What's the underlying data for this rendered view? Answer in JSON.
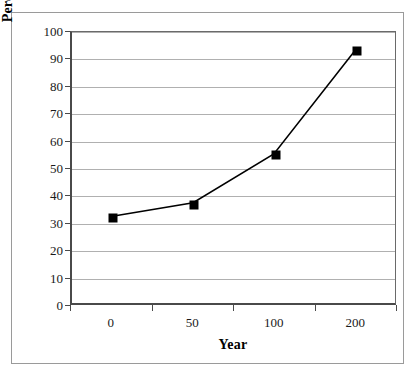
{
  "chart_data": {
    "type": "line",
    "title": "",
    "xlabel": "Year",
    "ylabel": "Percentage of Federal Lands",
    "categories": [
      "0",
      "50",
      "100",
      "200"
    ],
    "values": [
      32,
      37,
      55,
      93
    ],
    "series": [
      {
        "name": "Percentage of Federal Lands",
        "values": [
          32,
          37,
          55,
          93
        ]
      }
    ],
    "ylim": [
      0,
      100
    ],
    "ytick_labels": [
      "0",
      "10",
      "20",
      "30",
      "40",
      "50",
      "60",
      "70",
      "80",
      "90",
      "100"
    ],
    "ytick_values": [
      0,
      10,
      20,
      30,
      40,
      50,
      60,
      70,
      80,
      90,
      100
    ],
    "grid": "horizontal",
    "legend": "none",
    "marker": "square",
    "marker_color": "#000000",
    "line_color": "#000000",
    "gridline_color": "#b0b0b0",
    "axis_color": "#4a4a4a",
    "background_color": "#ffffff"
  }
}
